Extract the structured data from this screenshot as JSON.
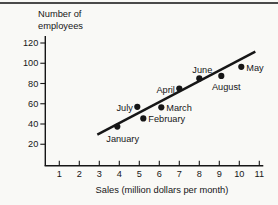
{
  "figure": {
    "colors": {
      "paper": "#f9f9f6",
      "ink": "#161616",
      "rule": "#4a4a4a"
    }
  },
  "chart_data": {
    "type": "scatter",
    "title": "",
    "ylabel_lines": [
      "Number of",
      "employees"
    ],
    "xlabel": "Sales (million dollars per month)",
    "x_ticks": [
      1,
      2,
      3,
      4,
      5,
      6,
      7,
      8,
      9,
      10,
      11
    ],
    "y_ticks": [
      20,
      40,
      60,
      80,
      100,
      120
    ],
    "xlim": [
      0.3,
      11.2
    ],
    "ylim": [
      0,
      127
    ],
    "grid": false,
    "legend": false,
    "points": [
      {
        "label": "January",
        "x": 3.9,
        "y": 37.5,
        "label_pos": "below_left"
      },
      {
        "label": "February",
        "x": 5.2,
        "y": 45.5,
        "label_pos": "right"
      },
      {
        "label": "March",
        "x": 6.1,
        "y": 56.5,
        "label_pos": "right"
      },
      {
        "label": "April",
        "x": 7.0,
        "y": 75,
        "label_pos": "left"
      },
      {
        "label": "May",
        "x": 10.1,
        "y": 96.5,
        "label_pos": "right"
      },
      {
        "label": "June",
        "x": 8.0,
        "y": 85,
        "label_pos": "above"
      },
      {
        "label": "July",
        "x": 4.9,
        "y": 57,
        "label_pos": "left"
      },
      {
        "label": "August",
        "x": 9.1,
        "y": 87.5,
        "label_pos": "below"
      }
    ],
    "trend_line": {
      "x1": 2.9,
      "y1": 29.5,
      "x2": 10.8,
      "y2": 111.5
    }
  }
}
